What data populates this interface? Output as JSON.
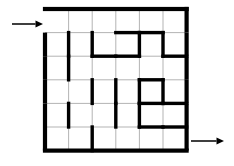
{
  "figure": {
    "name": "maze-puzzle",
    "type": "grid-maze",
    "rows": 6,
    "cols": 6,
    "colors": {
      "wall": "#000000",
      "gridline": "#b4b4b4",
      "background": "#ffffff",
      "arrow": "#000000"
    },
    "geometry": {
      "origin_x": 45,
      "origin_y": 9,
      "cell_size": 23.6,
      "wall_thickness": 3.4,
      "border_thickness": 4.2,
      "gridline_thickness": 1
    }
  },
  "entrance": {
    "label": "entry-arrow",
    "side": "left",
    "row": 1,
    "arrow_y": 24,
    "arrow_x_start": 12,
    "arrow_x_end": 43,
    "direction": "right"
  },
  "exit": {
    "label": "exit-arrow",
    "side": "right",
    "row": 6,
    "arrow_y": 141,
    "arrow_x_start": 191,
    "arrow_x_end": 224,
    "direction": "right"
  },
  "border_walls": {
    "top": true,
    "bottom": true,
    "left_segments": [
      2,
      3,
      4,
      5,
      6
    ],
    "right_segments": [
      1,
      2,
      3,
      4,
      5,
      6
    ]
  },
  "horizontal_walls": [
    {
      "row": 1,
      "col": 4
    },
    {
      "row": 1,
      "col": 5
    },
    {
      "row": 2,
      "col": 3
    },
    {
      "row": 2,
      "col": 4
    },
    {
      "row": 2,
      "col": 6
    },
    {
      "row": 3,
      "col": 5
    },
    {
      "row": 4,
      "col": 6
    },
    {
      "row": 4,
      "col": 5
    },
    {
      "row": 5,
      "col": 5
    },
    {
      "row": 5,
      "col": 6
    }
  ],
  "vertical_walls": [
    {
      "row": 2,
      "col": 1
    },
    {
      "row": 2,
      "col": 2
    },
    {
      "row": 2,
      "col": 4
    },
    {
      "row": 2,
      "col": 5
    },
    {
      "row": 3,
      "col": 1
    },
    {
      "row": 4,
      "col": 2
    },
    {
      "row": 4,
      "col": 3
    },
    {
      "row": 4,
      "col": 4
    },
    {
      "row": 4,
      "col": 5
    },
    {
      "row": 5,
      "col": 1
    },
    {
      "row": 5,
      "col": 3
    },
    {
      "row": 5,
      "col": 4
    },
    {
      "row": 6,
      "col": 2
    }
  ],
  "gridlines": {
    "horizontal_rows": [
      1,
      2,
      3,
      4,
      5
    ],
    "vertical_cols": [
      1,
      2,
      3,
      4,
      5
    ]
  }
}
